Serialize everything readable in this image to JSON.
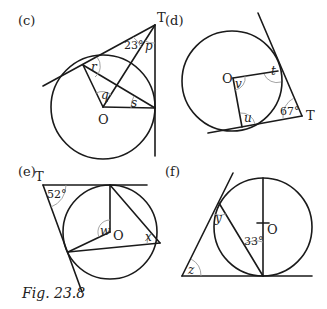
{
  "figure": {
    "caption": "Fig. 23.8",
    "panels": {
      "c": {
        "label": "(c)",
        "point_T": "T",
        "point_O": "O",
        "given_angle": "23°",
        "unknowns": [
          "p",
          "q",
          "r",
          "s"
        ]
      },
      "d": {
        "label": "(d)",
        "point_T": "T",
        "point_O": "O",
        "given_angle": "67°",
        "unknowns": [
          "t",
          "u",
          "v"
        ]
      },
      "e": {
        "label": "(e)",
        "point_T": "T",
        "point_O": "O",
        "given_angle": "52°",
        "unknowns": [
          "w",
          "x"
        ]
      },
      "f": {
        "label": "(f)",
        "point_O": "O",
        "given_angle": "33°",
        "unknowns": [
          "y",
          "z"
        ]
      }
    },
    "colors": {
      "line": "#1a1a1a",
      "angle_arc": "#9a9a9a",
      "background": "#ffffff"
    }
  }
}
